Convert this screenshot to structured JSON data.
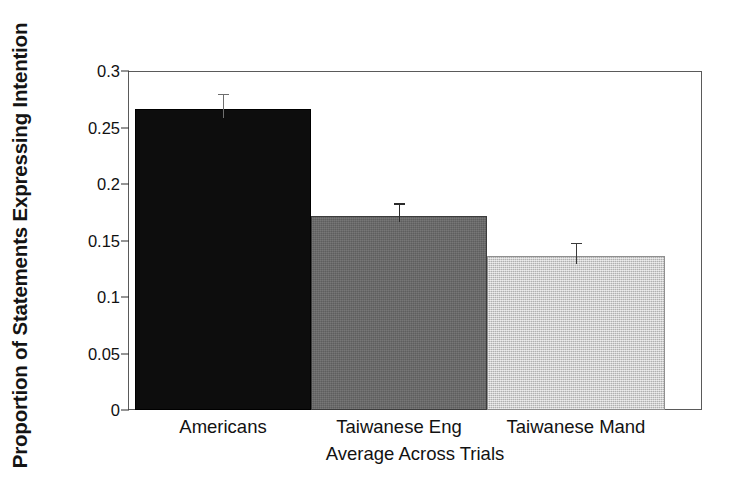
{
  "chart_data": {
    "type": "bar",
    "title": "",
    "subtitle": "",
    "xlabel": "Average Across Trials",
    "ylabel": "Proportion of Statements Expressing Intention",
    "categories": [
      "Americans",
      "Taiwanese Eng",
      "Taiwanese Mand"
    ],
    "values": [
      0.266,
      0.172,
      0.136
    ],
    "errors": [
      0.014,
      0.011,
      0.012
    ],
    "series": [
      {
        "name": "Proportion of Statements Expressing Intention",
        "values": [
          0.266,
          0.172,
          0.136
        ],
        "errors": [
          0.014,
          0.011,
          0.012
        ]
      }
    ],
    "bar_colors": [
      "#0d0d0d",
      "#686868",
      "#c3c3c3"
    ],
    "ylim": [
      0,
      0.3
    ],
    "xlim_note": "categorical, bars adjacent with no gap",
    "yticks": [
      0,
      0.05,
      0.1,
      0.15,
      0.2,
      0.25,
      0.3
    ],
    "ytick_labels": [
      "0",
      "0.05",
      "0.1",
      "0.15",
      "0.2",
      "0.25",
      "0.3"
    ],
    "grid": false,
    "legend": false,
    "legend_position": "none",
    "error_bar_style": "upper-only-with-cap",
    "frame": "box"
  },
  "axis": {
    "y_title": "Proportion of Statements Expressing Intention",
    "x_title": "Average Across Trials",
    "tick_labels_y": [
      "0.3",
      "0.25",
      "0.2",
      "0.15",
      "0.1",
      "0.05",
      "0"
    ],
    "tick_labels_x": [
      "Americans",
      "Taiwanese Eng",
      "Taiwanese Mand"
    ]
  },
  "colors": {
    "bar_dark": "#0d0d0d",
    "bar_medium": "#686868",
    "bar_light": "#c3c3c3",
    "frame": "#5a5a5a",
    "text": "#121212",
    "background": "#ffffff"
  }
}
